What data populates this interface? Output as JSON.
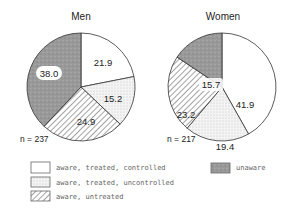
{
  "chart_data": [
    {
      "type": "pie",
      "title": "Men",
      "n_label": "n = 237",
      "start_angle": "12 o'clock",
      "direction": "clockwise",
      "slices": [
        {
          "label": "aware, treated, controlled",
          "value": 21.9,
          "display": "21.9"
        },
        {
          "label": "aware, treated, uncontrolled",
          "value": 15.2,
          "display": "15.2"
        },
        {
          "label": "aware, untreated",
          "value": 24.9,
          "display": "24.9"
        },
        {
          "label": "unaware",
          "value": 38.0,
          "display": "38.0"
        }
      ]
    },
    {
      "type": "pie",
      "title": "Women",
      "n_label": "n = 217",
      "start_angle": "12 o'clock",
      "direction": "clockwise",
      "slices": [
        {
          "label": "aware, treated, controlled",
          "value": 41.9,
          "display": "41.9"
        },
        {
          "label": "aware, treated, uncontrolled",
          "value": 19.4,
          "display": "19.4"
        },
        {
          "label": "aware, untreated",
          "value": 23.2,
          "display": "23.2"
        },
        {
          "label": "unaware",
          "value": 15.7,
          "display": "15.7"
        }
      ]
    }
  ],
  "legend": {
    "position": "bottom",
    "items": [
      {
        "label": "aware, treated, controlled",
        "pattern": "white"
      },
      {
        "label": "aware, treated, uncontrolled",
        "pattern": "stipple"
      },
      {
        "label": "aware, untreated",
        "pattern": "diagonal-hatch"
      },
      {
        "label": "unaware",
        "pattern": "dark-gray"
      }
    ]
  },
  "men": {
    "title": "Men",
    "n": "n = 237",
    "v0": "21.9",
    "v1": "15.2",
    "v2": "24.9",
    "v3": "38.0"
  },
  "women": {
    "title": "Women",
    "n": "n = 217",
    "v0": "41.9",
    "v1": "19.4",
    "v2": "23.2",
    "v3": "15.7"
  }
}
